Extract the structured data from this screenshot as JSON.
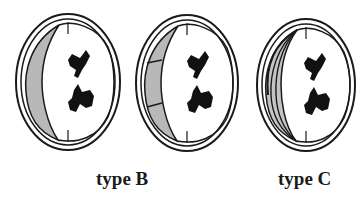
{
  "figure": {
    "panels": [
      {
        "id": "panel-1",
        "label": "",
        "variant": "solid-shaded-crescent"
      },
      {
        "id": "panel-2",
        "label": "type B",
        "variant": "segmented-shaded-crescent"
      },
      {
        "id": "panel-3",
        "label": "type C",
        "variant": "multi-layered-striped-crescent"
      }
    ]
  },
  "colors": {
    "stroke": "#1a1a1a",
    "shade": "#b8b8b8",
    "blot": "#111111",
    "background": "#ffffff"
  }
}
